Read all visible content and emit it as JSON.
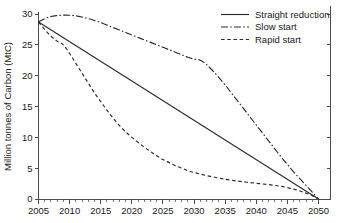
{
  "chart_data": {
    "type": "line",
    "title": "",
    "xlabel": "",
    "ylabel": "Million tonnes of Carbon (MtC)",
    "xlim": [
      2005,
      2050
    ],
    "ylim": [
      0,
      30
    ],
    "grid": false,
    "legend_position": "top-right",
    "x_ticks": [
      2005,
      2010,
      2015,
      2020,
      2025,
      2030,
      2035,
      2040,
      2045,
      2050
    ],
    "x_tick_labels": [
      "2005",
      "2010",
      "2015",
      "2020",
      "2025",
      "2030",
      "2035",
      "2040",
      "2045",
      "2050"
    ],
    "x_minor_tick_step": 1,
    "y_ticks": [
      0,
      5,
      10,
      15,
      20,
      25,
      30
    ],
    "y_tick_labels": [
      "0",
      "5",
      "10",
      "15",
      "20",
      "25",
      "30"
    ],
    "x": [
      2005,
      2006,
      2007,
      2008,
      2009,
      2010,
      2011,
      2012,
      2013,
      2014,
      2015,
      2016,
      2017,
      2018,
      2019,
      2020,
      2021,
      2022,
      2023,
      2024,
      2025,
      2026,
      2027,
      2028,
      2029,
      2030,
      2031,
      2032,
      2033,
      2034,
      2035,
      2036,
      2037,
      2038,
      2039,
      2040,
      2041,
      2042,
      2043,
      2044,
      2045,
      2046,
      2047,
      2048,
      2049,
      2050
    ],
    "series": [
      {
        "name": "Straight reduction",
        "style": "solid",
        "color": "#2b2b2b",
        "values": [
          28.7,
          28.06,
          27.43,
          26.79,
          26.16,
          25.52,
          24.89,
          24.25,
          23.62,
          22.98,
          22.35,
          21.71,
          21.08,
          20.44,
          19.81,
          19.17,
          18.53,
          17.9,
          17.26,
          16.63,
          15.99,
          15.36,
          14.72,
          14.09,
          13.45,
          12.82,
          12.18,
          11.55,
          10.91,
          10.28,
          9.64,
          9.01,
          8.37,
          7.74,
          7.1,
          6.46,
          5.83,
          5.19,
          4.56,
          3.92,
          3.29,
          2.65,
          2.02,
          1.38,
          0.75,
          0.0
        ]
      },
      {
        "name": "Slow start",
        "style": "dashdot",
        "color": "#2b2b2b",
        "values": [
          28.7,
          29.25,
          29.6,
          29.75,
          29.82,
          29.8,
          29.7,
          29.5,
          29.25,
          28.95,
          28.6,
          28.2,
          27.8,
          27.4,
          27.0,
          26.6,
          26.2,
          25.8,
          25.4,
          25.0,
          24.6,
          24.2,
          23.8,
          23.4,
          23.0,
          22.7,
          22.5,
          21.8,
          20.8,
          19.7,
          18.5,
          17.2,
          15.9,
          14.6,
          13.3,
          12.0,
          10.7,
          9.4,
          8.1,
          6.8,
          5.6,
          4.4,
          3.3,
          2.2,
          1.1,
          0.0
        ]
      },
      {
        "name": "Rapid start",
        "style": "dashed",
        "color": "#2b2b2b",
        "values": [
          28.7,
          27.5,
          26.4,
          25.6,
          25.0,
          23.6,
          22.0,
          20.4,
          18.8,
          17.2,
          15.8,
          14.4,
          13.1,
          11.9,
          10.9,
          10.0,
          9.2,
          8.4,
          7.7,
          7.0,
          6.4,
          5.9,
          5.4,
          5.0,
          4.6,
          4.3,
          4.05,
          3.8,
          3.6,
          3.4,
          3.2,
          3.05,
          2.9,
          2.78,
          2.66,
          2.55,
          2.44,
          2.33,
          2.2,
          2.05,
          1.85,
          1.6,
          1.3,
          0.95,
          0.55,
          0.0
        ]
      }
    ]
  },
  "legend": {
    "entries": [
      {
        "label": "Straight reduction"
      },
      {
        "label": "Slow start"
      },
      {
        "label": "Rapid start"
      }
    ]
  }
}
